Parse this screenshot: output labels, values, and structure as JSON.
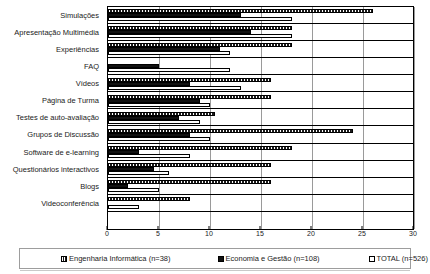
{
  "chart_data": {
    "type": "bar",
    "orientation": "horizontal",
    "title": "",
    "xlabel": "",
    "ylabel": "",
    "xlim": [
      0,
      30
    ],
    "xticks": [
      0,
      5,
      10,
      15,
      20,
      25,
      30
    ],
    "grid": true,
    "legend_position": "bottom",
    "categories": [
      "Simulações",
      "Apresentação Multimédia",
      "Experiências",
      "FAQ",
      "Vídeos",
      "Página de Turma",
      "Testes de auto-avaliação",
      "Grupos de Discussão",
      "Software de e-learning",
      "Questionários interactivos",
      "Blogs",
      "Videoconferência"
    ],
    "series": [
      {
        "name": "Engenharia Informática (n=38)",
        "key_style": "hatched",
        "values": [
          26,
          18,
          18,
          0,
          16,
          16,
          10.5,
          24,
          18,
          16,
          16,
          8
        ]
      },
      {
        "name": "Economia e Gestão (n=108)",
        "key_style": "solid-black",
        "values": [
          13,
          14,
          11,
          5,
          8,
          9,
          7,
          8,
          3,
          4.5,
          2,
          0
        ]
      },
      {
        "name": "TOTAL (n=526)",
        "key_style": "hollow-white",
        "values": [
          18,
          18,
          12,
          12,
          13,
          10,
          9,
          10,
          8,
          6,
          5,
          3
        ]
      }
    ]
  },
  "legend": {
    "items": [
      {
        "label": "Engenharia Informática (n=38)"
      },
      {
        "label": "Economia e Gestão (n=108)"
      },
      {
        "label": "TOTAL (n=526)"
      }
    ]
  }
}
